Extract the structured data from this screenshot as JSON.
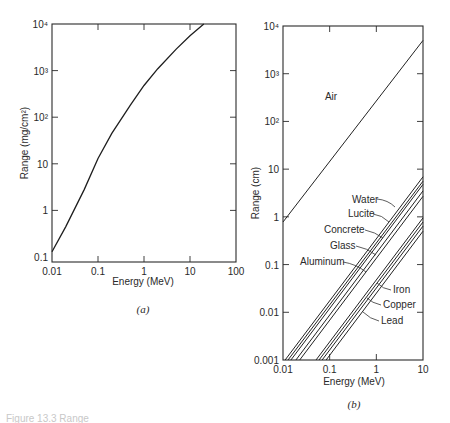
{
  "figure": {
    "caption": "Figure 13.3  Range",
    "panels": [
      {
        "id": "a",
        "sublabel": "(a)"
      },
      {
        "id": "b",
        "sublabel": "(b)"
      }
    ]
  },
  "chart_data": [
    {
      "type": "line",
      "panel": "(a)",
      "title": "",
      "xlabel": "Energy (MeV)",
      "ylabel": "Range (mg/cm²)",
      "xscale": "log",
      "yscale": "log",
      "xlim": [
        0.01,
        100
      ],
      "ylim": [
        0.1,
        10000
      ],
      "xticks": [
        "0.01",
        "0.1",
        "1",
        "10",
        "100"
      ],
      "yticks": [
        "0.1",
        "1",
        "10",
        "10²",
        "10³",
        "10⁴"
      ],
      "grid": false,
      "series": [
        {
          "name": "Range",
          "x": [
            0.01,
            0.02,
            0.05,
            0.1,
            0.2,
            0.5,
            1,
            2,
            5,
            10,
            20
          ],
          "y": [
            0.13,
            0.45,
            2.8,
            13,
            45,
            180,
            480,
            1100,
            2900,
            5600,
            10000
          ]
        }
      ]
    },
    {
      "type": "line",
      "panel": "(b)",
      "title": "",
      "xlabel": "Energy (MeV)",
      "ylabel": "Range (cm)",
      "xscale": "log",
      "yscale": "log",
      "xlim": [
        0.01,
        10
      ],
      "ylim": [
        0.001,
        10000
      ],
      "xticks": [
        "0.01",
        "0.1",
        "1",
        "10"
      ],
      "yticks": [
        "0.001",
        "0.01",
        "0.1",
        "1",
        "10",
        "10²",
        "10³",
        "10⁴"
      ],
      "grid": false,
      "series": [
        {
          "name": "Air",
          "x": [
            0.01,
            10
          ],
          "y": [
            0.78,
            5000
          ]
        },
        {
          "name": "Water",
          "x": [
            0.0111,
            10
          ],
          "y": [
            0.001,
            6.9
          ]
        },
        {
          "name": "Lucite",
          "x": [
            0.0128,
            10
          ],
          "y": [
            0.001,
            5.6
          ]
        },
        {
          "name": "Concrete",
          "x": [
            0.0148,
            10
          ],
          "y": [
            0.001,
            4.8
          ]
        },
        {
          "name": "Glass",
          "x": [
            0.0189,
            10
          ],
          "y": [
            0.001,
            3.5
          ]
        },
        {
          "name": "Aluminum",
          "x": [
            0.0228,
            10
          ],
          "y": [
            0.001,
            2.7
          ]
        },
        {
          "name": "Iron",
          "x": [
            0.051,
            10
          ],
          "y": [
            0.001,
            0.95
          ]
        },
        {
          "name": "Copper",
          "x": [
            0.059,
            10
          ],
          "y": [
            0.001,
            0.78
          ]
        },
        {
          "name": "Lead",
          "x": [
            0.069,
            10
          ],
          "y": [
            0.001,
            0.64
          ]
        },
        {
          "name": "",
          "x": [
            0.084,
            10
          ],
          "y": [
            0.001,
            0.5
          ]
        }
      ],
      "annotations": [
        {
          "text": "Air",
          "series": "Air"
        },
        {
          "text": "Water",
          "series": "Water"
        },
        {
          "text": "Lucite",
          "series": "Lucite"
        },
        {
          "text": "Concrete",
          "series": "Concrete"
        },
        {
          "text": "Glass",
          "series": "Glass"
        },
        {
          "text": "Aluminum",
          "series": "Aluminum"
        },
        {
          "text": "Iron",
          "series": "Iron"
        },
        {
          "text": "Copper",
          "series": "Copper"
        },
        {
          "text": "Lead",
          "series": "Lead"
        }
      ]
    }
  ]
}
